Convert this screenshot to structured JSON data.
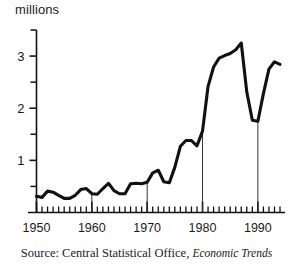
{
  "chart_data": {
    "type": "line",
    "title": "",
    "subtitle": "",
    "xlabel": "",
    "ylabel": "millions",
    "unit_label": "millions",
    "xlim": [
      1950,
      1994
    ],
    "ylim": [
      0,
      3.5
    ],
    "grid": false,
    "legend": null,
    "y_ticks_major": [
      1,
      2,
      3
    ],
    "y_ticks_major_labels": [
      "1",
      "2",
      "3"
    ],
    "y_ticks_minor": [
      0.5,
      1.5,
      2.5,
      3.5
    ],
    "x_ticks_major": [
      1950,
      1960,
      1970,
      1980,
      1990
    ],
    "x_ticks_major_labels": [
      "1950",
      "1960",
      "1970",
      "1980",
      "1990"
    ],
    "x_tick_minor_step": 1,
    "drop_lines_at": [
      1960,
      1970,
      1980,
      1990
    ],
    "series": [
      {
        "name": "Unemployment",
        "color": "#111111",
        "x": [
          1950,
          1951,
          1952,
          1953,
          1954,
          1955,
          1956,
          1957,
          1958,
          1959,
          1960,
          1961,
          1962,
          1963,
          1964,
          1965,
          1966,
          1967,
          1968,
          1969,
          1970,
          1971,
          1972,
          1973,
          1974,
          1975,
          1976,
          1977,
          1978,
          1979,
          1980,
          1981,
          1982,
          1983,
          1984,
          1985,
          1986,
          1987,
          1988,
          1989,
          1990,
          1991,
          1992,
          1993,
          1994
        ],
        "values": [
          0.31,
          0.29,
          0.41,
          0.39,
          0.33,
          0.27,
          0.27,
          0.33,
          0.44,
          0.46,
          0.36,
          0.35,
          0.46,
          0.56,
          0.42,
          0.36,
          0.36,
          0.55,
          0.56,
          0.55,
          0.58,
          0.76,
          0.81,
          0.59,
          0.57,
          0.87,
          1.27,
          1.38,
          1.38,
          1.28,
          1.56,
          2.42,
          2.79,
          2.96,
          3.01,
          3.05,
          3.12,
          3.25,
          2.31,
          1.77,
          1.75,
          2.28,
          2.75,
          2.89,
          2.84
        ],
        "peak": {
          "year": 1987,
          "value": 3.25
        },
        "trough_1990": {
          "year": 1990,
          "value": 1.75
        },
        "end": {
          "year": 1994,
          "value": 2.84
        }
      }
    ],
    "source_prefix": "Source: Central Statistical Office, ",
    "source_publication": "Economic Trends"
  },
  "source": {
    "prefix": "Source: Central Statistical Office, ",
    "publication": "Economic Trends"
  },
  "axis": {
    "unit_label": "millions"
  }
}
